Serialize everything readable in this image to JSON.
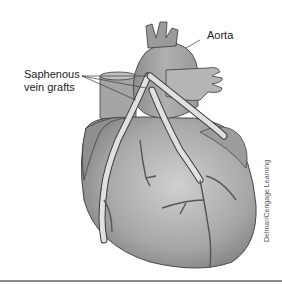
{
  "figure": {
    "labels": {
      "aorta": "Aorta",
      "grafts_line1": "Saphenous",
      "grafts_line2": "vein grafts"
    },
    "credit": "Delmar/Cengage Learning",
    "colors": {
      "heart_fill": "#9a9a9a",
      "heart_light": "#c8c8c8",
      "graft_fill": "#e0e0e0",
      "outline": "#3a3a3a",
      "rule": "#8a8a8a"
    }
  }
}
